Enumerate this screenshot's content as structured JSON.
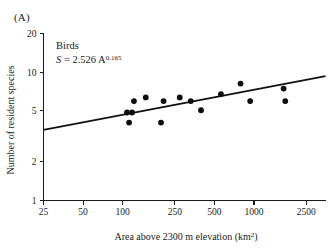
{
  "panel": {
    "label": "(A)"
  },
  "chart_data": {
    "type": "scatter",
    "title": "",
    "group_label": "Birds",
    "equation": {
      "lhs": "S",
      "operator": "=",
      "coefficient": "2.526",
      "variable": "A",
      "exponent": "0.165",
      "full": "S = 2.526 A^0.165"
    },
    "xlabel": "Area above 2300 m elevation (km",
    "xlabel_sup": "2",
    "xlabel_tail": ")",
    "xlabel_full": "Area above 2300 m elevation (km2)",
    "ylabel": "Number of resident species",
    "xscale": "log",
    "yscale": "log",
    "xlim": [
      25,
      3500
    ],
    "ylim": [
      1,
      20
    ],
    "xticks": [
      25,
      50,
      100,
      250,
      500,
      1000,
      2500
    ],
    "xtick_labels": [
      "25",
      "50",
      "100",
      "250",
      "500",
      "1000",
      "2500"
    ],
    "yticks": [
      1,
      2,
      5,
      10,
      20
    ],
    "ytick_labels": [
      "1",
      "2",
      "5",
      "10",
      "20"
    ],
    "grid": false,
    "legend": "none",
    "points": [
      {
        "x": 108,
        "y": 4.85
      },
      {
        "x": 112,
        "y": 4.05
      },
      {
        "x": 118,
        "y": 4.85
      },
      {
        "x": 122,
        "y": 5.95
      },
      {
        "x": 150,
        "y": 6.35
      },
      {
        "x": 196,
        "y": 4.05
      },
      {
        "x": 205,
        "y": 5.95
      },
      {
        "x": 272,
        "y": 6.35
      },
      {
        "x": 330,
        "y": 5.95
      },
      {
        "x": 395,
        "y": 5.05
      },
      {
        "x": 560,
        "y": 6.75
      },
      {
        "x": 790,
        "y": 8.15
      },
      {
        "x": 935,
        "y": 5.95
      },
      {
        "x": 1680,
        "y": 7.45
      },
      {
        "x": 1730,
        "y": 5.95
      }
    ],
    "fit": {
      "label": "power-law fit",
      "x_start": 25,
      "x_end": 3500,
      "y_start": 3.55,
      "y_end": 9.3
    }
  }
}
